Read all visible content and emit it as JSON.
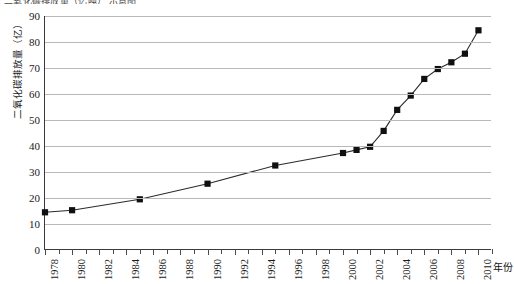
{
  "clipped_header_text": "二氧化碳排放量（亿吨）   示意图",
  "axes": {
    "y_title": "二氧化碳排放量（亿）",
    "x_title": "年份",
    "y_ticks": [
      0,
      10,
      20,
      30,
      40,
      50,
      60,
      70,
      80,
      90
    ],
    "x_ticks": [
      1978,
      1980,
      1982,
      1984,
      1986,
      1988,
      1990,
      1992,
      1994,
      1996,
      1998,
      2000,
      2002,
      2004,
      2006,
      2008,
      2010
    ],
    "x_tick_all_years_start": 1978,
    "x_tick_all_years_end": 2011
  },
  "chart_data": {
    "type": "line",
    "title": "",
    "subtitle": "",
    "xlabel": "年份",
    "ylabel": "二氧化碳排放量（亿）",
    "xlim": [
      1978,
      2011
    ],
    "ylim": [
      0,
      90
    ],
    "grid": true,
    "legend": null,
    "marker": "filled-square",
    "x": [
      1978,
      1980,
      1985,
      1990,
      1995,
      2000,
      2001,
      2002,
      2003,
      2004,
      2005,
      2006,
      2007,
      2008,
      2009,
      2010
    ],
    "values": [
      14.5,
      15.3,
      19.5,
      25.5,
      32.5,
      37.3,
      38.5,
      39.7,
      45.8,
      53.9,
      59.4,
      65.8,
      69.6,
      72.2,
      75.5,
      84.5
    ],
    "annotations": []
  }
}
